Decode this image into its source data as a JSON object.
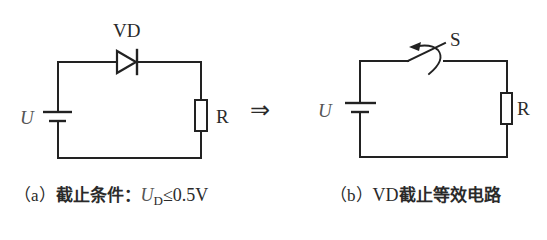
{
  "diagram": {
    "left_circuit": {
      "diode_label": "VD",
      "source_label": "U",
      "resistor_label": "R",
      "caption": {
        "prefix": "（a）",
        "text": "截止条件：",
        "symbol": "U",
        "subscript": "D",
        "condition": "≤0.5V"
      }
    },
    "transform_arrow": "⇒",
    "right_circuit": {
      "switch_label": "S",
      "source_label": "U",
      "resistor_label": "R",
      "caption": {
        "prefix": "（b）",
        "device": "VD",
        "text": "截止等效电路"
      }
    },
    "colors": {
      "line": "#222222",
      "text": "#2a2a2a",
      "italic_symbol": "#555555",
      "background": "#ffffff"
    }
  }
}
